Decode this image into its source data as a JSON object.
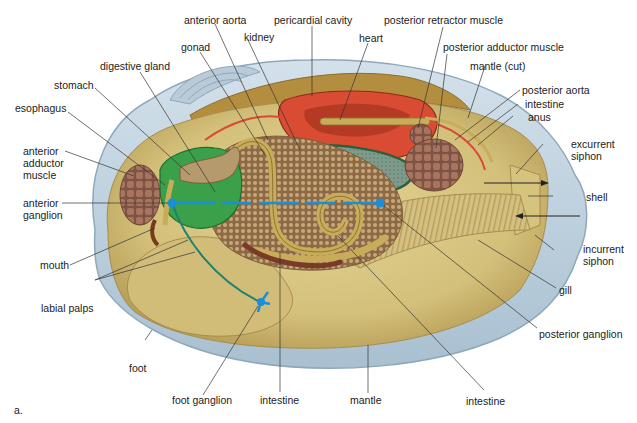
{
  "figure": {
    "letter": "a.",
    "caption_fragment": ""
  },
  "colors": {
    "shell": "#c5d6e3",
    "shell_edge": "#9fb6c8",
    "mantle": "#d9c983",
    "mantle_shadow": "#b9a15c",
    "pericardial": "#d94b32",
    "heart": "#c8402a",
    "digestive_gland": "#3aa14a",
    "kidney": "#2f6e45",
    "gonad": "#a07d55",
    "muscle": "#9b6b58",
    "intestine": "#c9ac5a",
    "nerve": "#1e8fa0",
    "ganglion": "#1a8fd8"
  },
  "labels": {
    "anterior_aorta": "anterior aorta",
    "pericardial_cavity": "pericardial cavity",
    "posterior_retractor_muscle": "posterior retractor muscle",
    "kidney": "kidney",
    "heart": "heart",
    "gonad": "gonad",
    "posterior_adductor_muscle": "posterior adductor muscle",
    "digestive_gland": "digestive gland",
    "mantle_cut": "mantle (cut)",
    "stomach": "stomach",
    "posterior_aorta": "posterior aorta",
    "intestine_top": "intestine",
    "esophagus": "esophagus",
    "anus": "anus",
    "anterior_adductor_muscle": "anterior adductor muscle",
    "excurrent_siphon": "excurrent siphon",
    "shell": "shell",
    "anterior_ganglion": "anterior ganglion",
    "incurrent_siphon": "incurrent siphon",
    "mouth": "mouth",
    "gill": "gill",
    "labial_palps": "labial palps",
    "posterior_ganglion": "posterior ganglion",
    "foot": "foot",
    "foot_ganglion": "foot ganglion",
    "intestine_bottom_mid": "intestine",
    "mantle": "mantle",
    "intestine_bottom_right": "intestine"
  }
}
